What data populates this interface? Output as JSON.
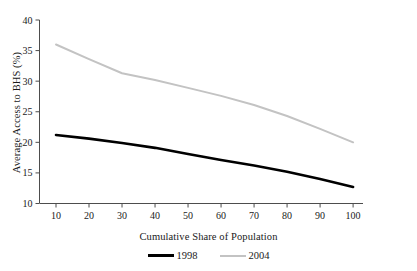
{
  "chart_data": {
    "type": "line",
    "title": "",
    "xlabel": "Cumulative Share of Population",
    "ylabel": "Average Access to BHS (%)",
    "xlim": [
      5,
      103
    ],
    "ylim": [
      10,
      40
    ],
    "xticks": [
      10,
      20,
      30,
      40,
      50,
      60,
      70,
      80,
      90,
      100
    ],
    "yticks": [
      10,
      15,
      20,
      25,
      30,
      35,
      40
    ],
    "grid": false,
    "legend_position": "bottom",
    "x": [
      10,
      20,
      30,
      40,
      50,
      60,
      70,
      80,
      90,
      100
    ],
    "series": [
      {
        "name": "1998",
        "color": "#000000",
        "values": [
          21.2,
          20.6,
          19.9,
          19.1,
          18.1,
          17.1,
          16.2,
          15.2,
          14.0,
          12.7
        ]
      },
      {
        "name": "2004",
        "color": "#c3c3c3",
        "values": [
          36.0,
          33.6,
          31.3,
          30.2,
          28.9,
          27.6,
          26.1,
          24.3,
          22.2,
          20.0
        ]
      }
    ]
  },
  "axis": {
    "ytick_labels": [
      "40",
      "35",
      "30",
      "25",
      "20",
      "15",
      "10"
    ],
    "xtick_labels": [
      "10",
      "20",
      "30",
      "40",
      "50",
      "60",
      "70",
      "80",
      "90",
      "100"
    ]
  },
  "legend": {
    "items": [
      {
        "label": "1998"
      },
      {
        "label": "2004"
      }
    ]
  }
}
